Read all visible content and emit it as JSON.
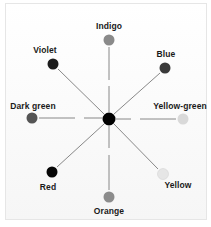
{
  "diagram": {
    "type": "color-wheel-star",
    "center": {
      "x": 109,
      "y": 119,
      "r": 6.5,
      "color": "#000000"
    },
    "line_color": "#7a7a7a",
    "nodes": [
      {
        "name": "Indigo",
        "x": 109,
        "y": 40,
        "r": 5.5,
        "color": "#8a8a8a",
        "label_x": 109,
        "label_y": 26
      },
      {
        "name": "Blue",
        "x": 165,
        "y": 68,
        "r": 5.5,
        "color": "#3a3a3a",
        "label_x": 166,
        "label_y": 54
      },
      {
        "name": "Yellow-green",
        "x": 183,
        "y": 119,
        "r": 5.5,
        "color": "#d9d9d9",
        "label_x": 180,
        "label_y": 106
      },
      {
        "name": "Yellow",
        "x": 163,
        "y": 174,
        "r": 5.5,
        "color": "#e6e6e6",
        "label_x": 178,
        "label_y": 185
      },
      {
        "name": "Orange",
        "x": 109,
        "y": 197,
        "r": 5.5,
        "color": "#8c8c8c",
        "label_x": 109,
        "label_y": 211
      },
      {
        "name": "Red",
        "x": 52,
        "y": 172,
        "r": 5.5,
        "color": "#060606",
        "label_x": 48,
        "label_y": 187
      },
      {
        "name": "Dark green",
        "x": 32,
        "y": 118,
        "r": 5.5,
        "color": "#555555",
        "label_x": 33,
        "label_y": 106
      },
      {
        "name": "Violet",
        "x": 53,
        "y": 64,
        "r": 5.5,
        "color": "#1c1c1c",
        "label_x": 45,
        "label_y": 50
      }
    ]
  },
  "labels": {
    "indigo": "Indigo",
    "blue": "Blue",
    "yellow_green": "Yellow-green",
    "yellow": "Yellow",
    "orange": "Orange",
    "red": "Red",
    "dark_green": "Dark green",
    "violet": "Violet"
  }
}
